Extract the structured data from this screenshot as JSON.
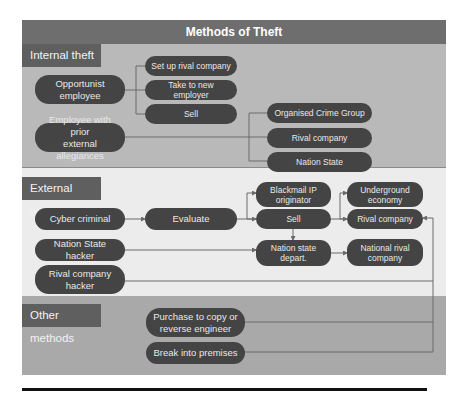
{
  "title": "Methods of Theft",
  "sections": {
    "internal": {
      "label": "Internal theft",
      "sources": {
        "opportunist": "Opportunist\nemployee",
        "prior_allegiance": "Employee with prior\nexternal allegiances"
      },
      "opportunist_outcomes": [
        "Set up rival company",
        "Take to new employer",
        "Sell"
      ],
      "allegiance_targets": [
        "Organised Crime Group",
        "Rival company",
        "Nation State"
      ]
    },
    "external": {
      "label": "External attack",
      "sources": {
        "cyber_criminal": "Cyber criminal",
        "nation_state_hacker": "Nation State hacker",
        "rival_hacker": "Rival company\nhacker"
      },
      "evaluate": "Evaluate",
      "blackmail": "Blackmail IP\noriginator",
      "sell": "Sell",
      "nation_state_depart": "Nation state\ndepart.",
      "underground": "Underground\neconomy",
      "rival_company": "Rival company",
      "national_rival": "National rival\ncompany"
    },
    "other": {
      "label": "Other methods",
      "items": [
        "Purchase to copy or\nreverse engineer",
        "Break into premises"
      ]
    }
  },
  "colors": {
    "title_bar": "#6e6e6e",
    "internal_bg": "#b9b9b9",
    "external_bg": "#ececec",
    "other_bg": "#a9a9a9",
    "pill": "#444444",
    "label_box": "#5f5f5f",
    "connector": "#6a6a6a"
  }
}
